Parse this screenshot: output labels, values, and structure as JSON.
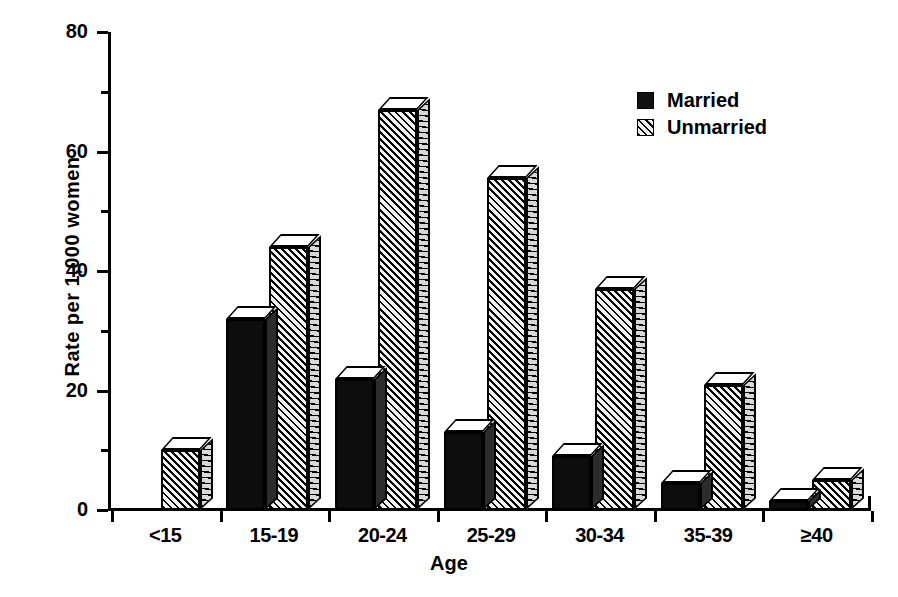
{
  "chart_data": {
    "type": "bar",
    "title": "",
    "xlabel": "Age",
    "ylabel": "Rate per 1,000 women",
    "categories": [
      "<15",
      "15-19",
      "20-24",
      "25-29",
      "30-34",
      "35-39",
      "≥40"
    ],
    "series": [
      {
        "name": "Married",
        "values": [
          0,
          32,
          22,
          13,
          9,
          4.5,
          1.5
        ],
        "color": "#111111",
        "pattern": "solid"
      },
      {
        "name": "Unmarried",
        "values": [
          10,
          44,
          67,
          55.5,
          37,
          21,
          5
        ],
        "color": "#000000",
        "pattern": "diagonal-hatch"
      }
    ],
    "ylim": [
      0,
      80
    ],
    "yticks_major": [
      0,
      20,
      40,
      60,
      80
    ],
    "yticks_minor": [
      10,
      30,
      50,
      70
    ],
    "ytick_labels": [
      "0",
      "20",
      "40",
      "60",
      "80"
    ],
    "grid": false,
    "legend_position": "top-right",
    "legend_entries": [
      "Married",
      "Unmarried"
    ]
  },
  "axis": {
    "y_title": "Rate per 1,000 women",
    "x_title": "Age"
  }
}
